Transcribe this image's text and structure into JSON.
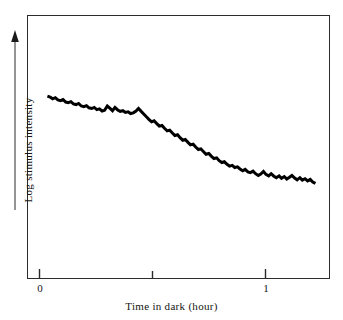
{
  "figure": {
    "background_color": "#ffffff",
    "frame_color": "#2b2b2b",
    "curve_color": "#000000"
  },
  "axes": {
    "x_title": "Time in dark (hour)",
    "y_title": "Log stimulus intensity",
    "y_arrow_name": "up-arrow",
    "x_tick_labels": [
      "0",
      "1"
    ],
    "x_tick_values": [
      0,
      0.5,
      1
    ],
    "x_tick_labelled": [
      true,
      false,
      true
    ]
  },
  "chart_data": {
    "type": "line",
    "title": "",
    "subtitle": "",
    "xlabel": "Time in dark (hour)",
    "ylabel": "Log stimulus intensity",
    "xlim": [
      0,
      1.24
    ],
    "ylim": [
      0,
      10
    ],
    "grid": false,
    "legend": null,
    "annotations": [],
    "axis_style": "framed-box with arrow on y-axis, unlabelled y scale",
    "series": [
      {
        "name": "Dark adaptation curve",
        "color": "#000000",
        "line_width": 3,
        "x": [
          0.035,
          0.047,
          0.058,
          0.07,
          0.081,
          0.093,
          0.104,
          0.116,
          0.127,
          0.139,
          0.15,
          0.162,
          0.173,
          0.185,
          0.196,
          0.208,
          0.219,
          0.231,
          0.242,
          0.254,
          0.265,
          0.277,
          0.288,
          0.3,
          0.311,
          0.323,
          0.334,
          0.346,
          0.357,
          0.369,
          0.38,
          0.392,
          0.403,
          0.415,
          0.427,
          0.438,
          0.45,
          0.461,
          0.473,
          0.484,
          0.496,
          0.507,
          0.519,
          0.53,
          0.542,
          0.553,
          0.565,
          0.576,
          0.588,
          0.599,
          0.611,
          0.622,
          0.634,
          0.645,
          0.657,
          0.668,
          0.68,
          0.691,
          0.703,
          0.714,
          0.726,
          0.737,
          0.749,
          0.761,
          0.772,
          0.784,
          0.795,
          0.807,
          0.818,
          0.83,
          0.841,
          0.853,
          0.864,
          0.876,
          0.887,
          0.899,
          0.91,
          0.922,
          0.933,
          0.945,
          0.956,
          0.968,
          0.979,
          0.991,
          1.002,
          1.014,
          1.025,
          1.037,
          1.048,
          1.06,
          1.071,
          1.083,
          1.094,
          1.106,
          1.117,
          1.129,
          1.14,
          1.152,
          1.163,
          1.175,
          1.186,
          1.198,
          1.209,
          1.221
        ],
        "y": [
          8.55,
          8.5,
          8.4,
          8.46,
          8.34,
          8.3,
          8.36,
          8.22,
          8.18,
          8.24,
          8.12,
          8.08,
          8.14,
          8.0,
          7.96,
          8.02,
          7.9,
          7.86,
          7.92,
          7.8,
          7.84,
          7.72,
          7.76,
          8.0,
          7.88,
          7.74,
          7.92,
          7.78,
          7.7,
          7.74,
          7.64,
          7.68,
          7.58,
          7.62,
          7.72,
          7.86,
          7.7,
          7.56,
          7.4,
          7.26,
          7.12,
          7.18,
          7.02,
          6.88,
          6.92,
          6.76,
          6.62,
          6.66,
          6.5,
          6.36,
          6.4,
          6.24,
          6.1,
          6.14,
          5.98,
          5.84,
          5.88,
          5.72,
          5.58,
          5.62,
          5.46,
          5.32,
          5.36,
          5.2,
          5.08,
          5.12,
          4.96,
          4.86,
          4.9,
          4.76,
          4.66,
          4.7,
          4.58,
          4.62,
          4.5,
          4.4,
          4.48,
          4.34,
          4.3,
          4.38,
          4.24,
          4.14,
          4.22,
          4.36,
          4.2,
          4.12,
          4.24,
          4.1,
          4.02,
          4.12,
          3.98,
          4.08,
          3.94,
          4.04,
          4.14,
          4.0,
          3.9,
          4.02,
          3.88,
          3.96,
          3.84,
          3.92,
          3.78,
          3.7
        ]
      }
    ]
  }
}
